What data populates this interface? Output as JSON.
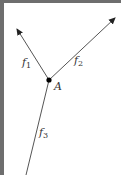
{
  "diagram": {
    "type": "force-vector-diagram",
    "point": {
      "label": "A",
      "x": 49,
      "y": 80
    },
    "vectors": [
      {
        "name": "f1",
        "label": "f",
        "subscript": "1",
        "from": [
          49,
          80
        ],
        "to": [
          16,
          28
        ],
        "arrow": true
      },
      {
        "name": "f2",
        "label": "f",
        "subscript": "2",
        "from": [
          49,
          80
        ],
        "to": [
          116,
          17
        ],
        "arrow": true
      },
      {
        "name": "f3",
        "label": "f",
        "subscript": "3",
        "from": [
          49,
          80
        ],
        "to": [
          26,
          175
        ],
        "arrow": false
      }
    ],
    "labels": {
      "f1": {
        "base": "f",
        "sub": "1"
      },
      "f2": {
        "base": "f",
        "sub": "2"
      },
      "f3": {
        "base": "f",
        "sub": "3"
      },
      "point": "A"
    },
    "colors": {
      "line": "#555555",
      "border": "#6e6e6e",
      "point": "#000000"
    }
  }
}
